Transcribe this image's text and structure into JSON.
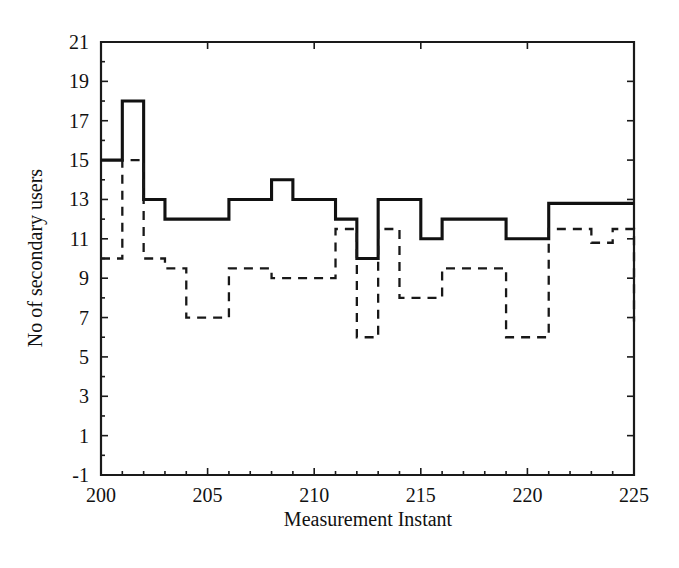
{
  "chart_data": {
    "type": "line",
    "title": "",
    "xlabel": "Measurement Instant",
    "ylabel": "No of secondary users",
    "xlim": [
      200,
      225
    ],
    "ylim": [
      -1,
      21
    ],
    "xticks": [
      200,
      205,
      210,
      215,
      220,
      225
    ],
    "yticks": [
      -1,
      1,
      3,
      5,
      7,
      9,
      11,
      13,
      15,
      17,
      19,
      21
    ],
    "xtick_labels": [
      "200",
      "205",
      "210",
      "215",
      "220",
      "225"
    ],
    "ytick_labels": [
      "-1",
      "1",
      "3",
      "5",
      "7",
      "9",
      "11",
      "13",
      "15",
      "17",
      "19",
      "21"
    ],
    "minor_ytick_step": 1,
    "grid": false,
    "legend": null,
    "drawstyle": "steps-post",
    "x": [
      200,
      201,
      202,
      203,
      204,
      205,
      206,
      207,
      208,
      209,
      210,
      211,
      212,
      213,
      214,
      215,
      216,
      217,
      218,
      219,
      220,
      221,
      222,
      223,
      224,
      225
    ],
    "series": [
      {
        "name": "solid",
        "style": "solid",
        "color": "#111111",
        "values": [
          15,
          18,
          13,
          12,
          12,
          12,
          13,
          13,
          14,
          13,
          13,
          12,
          10,
          13,
          13,
          11,
          12,
          12,
          12,
          11,
          11,
          12.8,
          12.8,
          12.8,
          12.8,
          12.8
        ]
      },
      {
        "name": "dashed",
        "style": "dashed",
        "color": "#181818",
        "values": [
          10,
          15,
          10,
          9.5,
          7,
          7,
          9.5,
          9.5,
          9,
          9,
          9,
          11.5,
          6,
          11.5,
          8,
          8,
          9.5,
          9.5,
          9.5,
          6,
          6,
          11.5,
          11.5,
          10.8,
          11.5,
          6.8
        ]
      }
    ]
  },
  "labels": {
    "xlabel": "Measurement Instant",
    "ylabel": "No of secondary users"
  }
}
